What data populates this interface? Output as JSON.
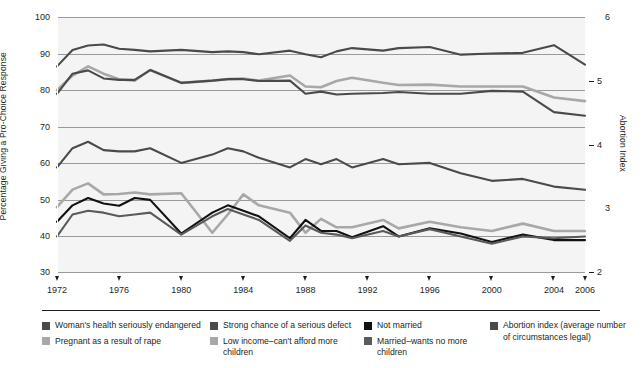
{
  "axes": {
    "ylabel_left": "Percentage  Giving a Pro-Choice Response",
    "ylabel_right": "Abortion Index",
    "yticks_left": [
      "100",
      "90",
      "80",
      "70",
      "60",
      "50",
      "40",
      "30"
    ],
    "yticks_right": [
      "6",
      "5",
      "4",
      "3",
      "2"
    ],
    "xticks": [
      "1972",
      "1976",
      "1980",
      "1984",
      "1988",
      "1992",
      "1996",
      "2000",
      "2004",
      "2006"
    ]
  },
  "legend": {
    "columns": [
      {
        "items": [
          {
            "label": "Woman's health seriously endangered",
            "color": "#4a4a4a"
          },
          {
            "label": "Pregnant as a result of rape",
            "color": "#a8a8a8"
          }
        ]
      },
      {
        "items": [
          {
            "label": "Strong chance of a serious defect",
            "color": "#4a4a4a"
          },
          {
            "label": "Low income–can't afford more children",
            "color": "#a8a8a8"
          }
        ]
      },
      {
        "items": [
          {
            "label": "Not married",
            "color": "#111111"
          },
          {
            "label": "Married–wants no more children",
            "color": "#5a5a5a"
          }
        ]
      },
      {
        "items": [
          {
            "label": "Abortion index (average number of circumstances legal)",
            "color": "#4a4a4a"
          }
        ]
      }
    ]
  },
  "chart_data": {
    "type": "line",
    "title": "",
    "xlabel": "",
    "ylabel": "Percentage  Giving a Pro-Choice Response",
    "ylabel_secondary": "Abortion Index",
    "xlim": [
      1972,
      2006
    ],
    "ylim": [
      30,
      100
    ],
    "ylim_secondary": [
      2,
      6
    ],
    "grid": true,
    "legend_position": "bottom",
    "x": [
      1972,
      1973,
      1974,
      1975,
      1976,
      1977,
      1978,
      1980,
      1982,
      1983,
      1984,
      1985,
      1987,
      1988,
      1989,
      1990,
      1991,
      1993,
      1994,
      1996,
      1998,
      2000,
      2002,
      2004,
      2006
    ],
    "series": [
      {
        "name": "Woman's health seriously endangered",
        "color": "#4a4a4a",
        "axis": "left",
        "values": [
          86.5,
          91.0,
          92.2,
          92.5,
          91.3,
          91.0,
          90.6,
          91.0,
          90.4,
          90.6,
          90.4,
          89.8,
          90.8,
          89.8,
          89.0,
          90.6,
          91.5,
          90.8,
          91.5,
          91.8,
          89.7,
          90.0,
          90.2,
          92.3,
          87.0
        ]
      },
      {
        "name": "Pregnant as a result of rape",
        "color": "#a8a8a8",
        "axis": "left",
        "values": [
          80.0,
          84.0,
          86.5,
          84.5,
          83.0,
          82.6,
          85.5,
          82.0,
          82.6,
          83.0,
          83.2,
          82.6,
          84.0,
          81.0,
          80.8,
          82.5,
          83.4,
          82.0,
          81.4,
          81.5,
          81.0,
          81.0,
          81.0,
          78.0,
          77.0
        ]
      },
      {
        "name": "Strong chance of a serious defect",
        "color": "#4a4a4a",
        "axis": "left",
        "values": [
          79.0,
          84.5,
          85.4,
          83.2,
          82.8,
          82.8,
          85.5,
          82.0,
          82.6,
          83.0,
          83.0,
          82.5,
          82.6,
          79.0,
          79.6,
          78.8,
          79.0,
          79.2,
          79.5,
          79.0,
          79.0,
          79.8,
          79.6,
          74.0,
          73.0
        ]
      },
      {
        "name": "Low income–can't afford more children",
        "color": "#a8a8a8",
        "axis": "left",
        "values": [
          48.0,
          52.8,
          54.5,
          51.5,
          51.6,
          52.0,
          51.5,
          51.8,
          41.0,
          46.0,
          51.5,
          48.5,
          46.5,
          41.0,
          44.8,
          42.5,
          42.5,
          44.5,
          42.2,
          44.0,
          42.5,
          41.5,
          43.5,
          41.5,
          41.5
        ]
      },
      {
        "name": "Not married",
        "color": "#111111",
        "axis": "left",
        "values": [
          44.0,
          48.5,
          50.5,
          49.0,
          48.4,
          50.5,
          50.0,
          40.8,
          46.5,
          48.5,
          47.0,
          45.5,
          39.5,
          44.5,
          41.5,
          41.5,
          39.8,
          42.8,
          40.0,
          42.2,
          40.8,
          38.5,
          40.5,
          39.0,
          39.0
        ]
      },
      {
        "name": "Married–wants no more children",
        "color": "#5a5a5a",
        "axis": "left",
        "values": [
          40.0,
          46.0,
          47.0,
          46.5,
          45.5,
          46.0,
          46.5,
          40.5,
          45.5,
          47.5,
          46.0,
          44.5,
          38.8,
          43.0,
          41.0,
          40.5,
          39.5,
          41.5,
          40.0,
          42.0,
          40.0,
          38.0,
          40.0,
          39.5,
          40.0
        ]
      },
      {
        "name": "Abortion index (average number of circumstances legal)",
        "color": "#4a4a4a",
        "axis": "right",
        "values": [
          3.65,
          3.95,
          4.05,
          3.92,
          3.9,
          3.9,
          3.95,
          3.72,
          3.85,
          3.95,
          3.9,
          3.8,
          3.65,
          3.78,
          3.7,
          3.78,
          3.65,
          3.78,
          3.7,
          3.72,
          3.56,
          3.44,
          3.47,
          3.35,
          3.3
        ]
      }
    ]
  }
}
